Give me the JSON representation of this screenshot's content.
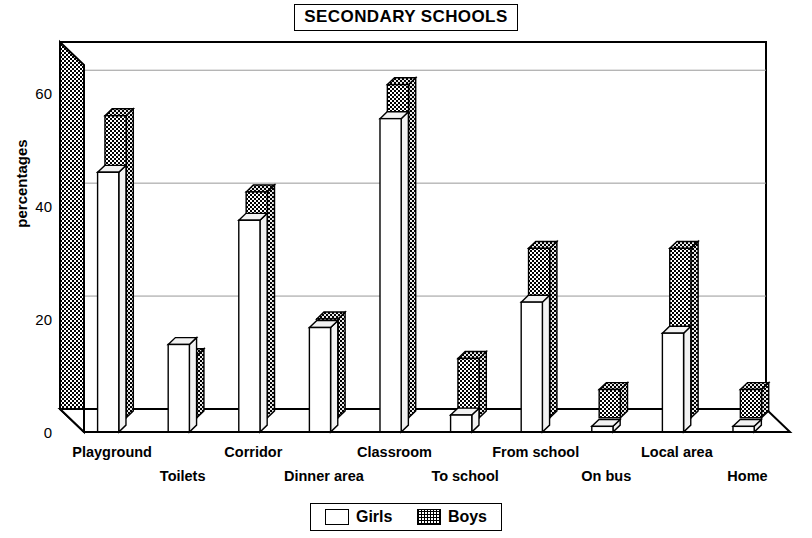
{
  "title": "SECONDARY SCHOOLS",
  "y_axis_title": "percentages",
  "legend": {
    "girls_label": "Girls",
    "boys_label": "Boys"
  },
  "chart_data": {
    "type": "bar",
    "title": "SECONDARY SCHOOLS",
    "xlabel": "",
    "ylabel": "percentages",
    "ylim": [
      0,
      65
    ],
    "yticks": [
      0,
      20,
      40,
      60
    ],
    "grid": true,
    "legend_position": "bottom",
    "style": "3d-grouped-bars",
    "categories": [
      "Playground",
      "Toilets",
      "Corridor",
      "Dinner area",
      "Classroom",
      "To school",
      "From school",
      "On bus",
      "Local area",
      "Home"
    ],
    "series": [
      {
        "name": "Girls",
        "fill": "white",
        "values": [
          46,
          15.5,
          37.5,
          18.5,
          55.5,
          3,
          23,
          1,
          17.5,
          1
        ]
      },
      {
        "name": "Boys",
        "fill": "checkered",
        "values": [
          53.5,
          11,
          40,
          17.5,
          59,
          10.5,
          30,
          5,
          30,
          5
        ]
      }
    ]
  },
  "colors": {
    "line": "#000000",
    "bar_fill": "#ffffff",
    "grid": "#999999",
    "pattern": "#000000"
  }
}
